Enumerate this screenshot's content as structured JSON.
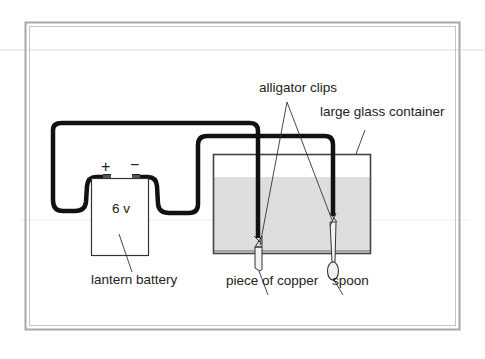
{
  "diagram": {
    "type": "electroplating-circuit",
    "colors": {
      "frame": "#a8a8a8",
      "wire": "#111111",
      "outline": "#333333",
      "water": "#dedede",
      "guide_line": "#d6d6d6"
    },
    "battery": {
      "voltage_label": "6 v",
      "positive_sign": "+",
      "negative_sign": "−"
    },
    "labels": {
      "alligator_clips": "alligator clips",
      "container": "large glass container",
      "battery": "lantern battery",
      "copper": "piece of copper",
      "spoon": "spoon"
    }
  }
}
